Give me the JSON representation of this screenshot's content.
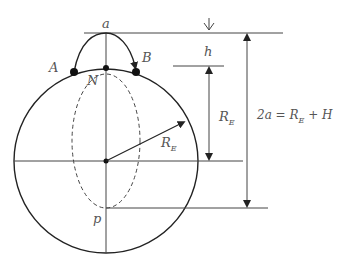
{
  "diagram": {
    "labels": {
      "a": "a",
      "A": "A",
      "B": "B",
      "N": "N",
      "p": "p",
      "h": "h",
      "re_vertical": "R",
      "re_vertical_sub": "E",
      "re_radius": "R",
      "re_radius_sub": "E",
      "equation_prefix": "2a = R",
      "equation_sub": "E",
      "equation_suffix": " + H"
    },
    "colors": {
      "line": "#333333",
      "label": "#555555",
      "background": "#ffffff"
    }
  }
}
